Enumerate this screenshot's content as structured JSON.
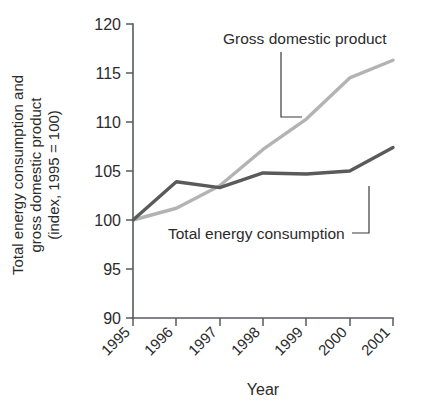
{
  "chart_data": {
    "type": "line",
    "title": "",
    "xlabel": "Year",
    "ylabel": "Total energy consumption and gross domestic product (index, 1995 = 100)",
    "ylabel_lines": [
      "Total energy consumption and",
      "gross domestic product",
      "(index, 1995 = 100)"
    ],
    "categories": [
      "1995",
      "1996",
      "1997",
      "1998",
      "1999",
      "2000",
      "2001"
    ],
    "x": [
      1995,
      1996,
      1997,
      1998,
      1999,
      2000,
      2001
    ],
    "xlim": [
      1995,
      2001
    ],
    "ylim": [
      90,
      120
    ],
    "yticks": [
      "120",
      "115",
      "110",
      "105",
      "100",
      "95",
      "90"
    ],
    "ytick_values": [
      120,
      115,
      110,
      105,
      100,
      95,
      90
    ],
    "grid": false,
    "legend": "annotations",
    "series": [
      {
        "name": "Gross domestic product",
        "color": "#b3b3b3",
        "values": [
          100.0,
          101.2,
          103.5,
          107.2,
          110.3,
          114.5,
          116.3
        ]
      },
      {
        "name": "Total energy consumption",
        "color": "#5a5a5a",
        "values": [
          100.0,
          103.9,
          103.3,
          104.8,
          104.7,
          105.0,
          107.4
        ]
      }
    ],
    "annotations": [
      {
        "text": "Gross domestic product",
        "series": "Gross domestic product",
        "text_x": 223,
        "text_y": 44,
        "leader": "M281,52 L281,117 L302,117"
      },
      {
        "text": "Total energy consumption",
        "series": "Total energy consumption",
        "text_x": 168,
        "text_y": 239,
        "leader": "M352,233 L369,233 L369,186"
      }
    ]
  },
  "plot_geometry": {
    "x_axis_px": [
      133,
      393
    ],
    "y_axis_px": [
      24,
      318
    ],
    "axis_color": "#555b5e"
  }
}
